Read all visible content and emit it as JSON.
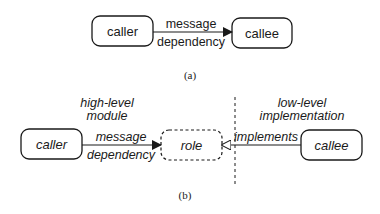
{
  "part_a": {
    "caption": "(a)",
    "nodes": {
      "caller": {
        "label": "caller"
      },
      "callee": {
        "label": "callee"
      }
    },
    "edge": {
      "label_top": "message",
      "label_bottom": "dependency",
      "arrow": "filled-triangle"
    }
  },
  "part_b": {
    "caption": "(b)",
    "regions": {
      "left_title": [
        "high-level",
        "module"
      ],
      "right_title": [
        "low-level",
        "implementation"
      ]
    },
    "nodes": {
      "caller": {
        "label": "caller"
      },
      "role": {
        "label": "role",
        "style": "dashed"
      },
      "callee": {
        "label": "callee"
      }
    },
    "edges": {
      "message": {
        "label_top": "message",
        "label_bottom": "dependency",
        "arrow": "filled-triangle"
      },
      "implements": {
        "label": "implements",
        "arrow": "hollow-triangle"
      }
    },
    "divider": "dashed-vertical"
  },
  "colors": {
    "stroke": "#1a1a1a",
    "background": "#ffffff"
  }
}
